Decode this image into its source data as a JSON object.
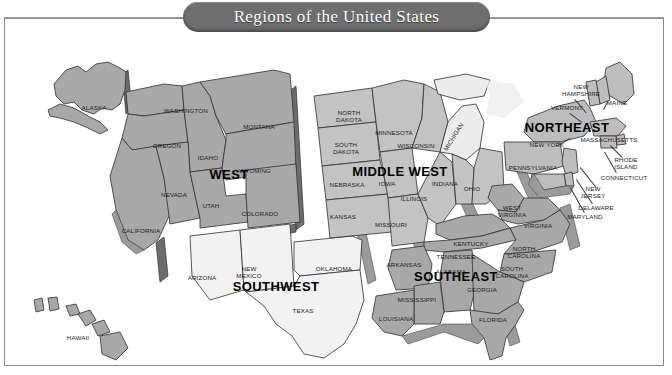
{
  "title": "Regions of the United States",
  "frame": {
    "border_color": "#8d8d8d",
    "background": "#ffffff"
  },
  "banner": {
    "fill": "#6e6e6e",
    "text_color": "#ffffff"
  },
  "regions": [
    {
      "key": "west",
      "label": "WEST",
      "fill": "#a8a8a8",
      "x": 225,
      "y": 156
    },
    {
      "key": "southwest",
      "label": "SOUTHWEST",
      "fill": "#f2f2f2",
      "x": 272,
      "y": 268
    },
    {
      "key": "middlewest",
      "label": "MIDDLE WEST",
      "fill": "#c3c3c3",
      "x": 396,
      "y": 153
    },
    {
      "key": "southeast",
      "label": "SOUTHEAST",
      "fill": "#a8a8a8",
      "x": 452,
      "y": 258
    },
    {
      "key": "northeast",
      "label": "NORTHEAST",
      "fill": "#bdbdbd",
      "x": 563,
      "y": 109
    }
  ],
  "states": [
    {
      "name": "ALASKA",
      "region": "west",
      "x": 90,
      "y": 90,
      "text": "ALASKA"
    },
    {
      "name": "HAWAII",
      "region": "west",
      "x": 74,
      "y": 320,
      "text": "HAWAII"
    },
    {
      "name": "WASHINGTON",
      "region": "west",
      "x": 182,
      "y": 93,
      "text": "WASHINGTON"
    },
    {
      "name": "OREGON",
      "region": "west",
      "x": 163,
      "y": 128,
      "text": "OREGON"
    },
    {
      "name": "CALIFORNIA",
      "region": "west",
      "x": 137,
      "y": 213,
      "text": "CALIFORNIA"
    },
    {
      "name": "IDAHO",
      "region": "west",
      "x": 204,
      "y": 140,
      "text": "IDAHO"
    },
    {
      "name": "NEVADA",
      "region": "west",
      "x": 170,
      "y": 177,
      "text": "NEVADA"
    },
    {
      "name": "UTAH",
      "region": "west",
      "x": 207,
      "y": 188,
      "text": "UTAH"
    },
    {
      "name": "MONTANA",
      "region": "west",
      "x": 255,
      "y": 109,
      "text": "MONTANA"
    },
    {
      "name": "WYOMING",
      "region": "west",
      "x": 251,
      "y": 153,
      "text": "WYOMING"
    },
    {
      "name": "COLORADO",
      "region": "west",
      "x": 256,
      "y": 196,
      "text": "COLORADO"
    },
    {
      "name": "ARIZONA",
      "region": "southwest",
      "x": 198,
      "y": 260,
      "text": "ARIZONA"
    },
    {
      "name": "NEW MEXICO",
      "region": "southwest",
      "x": 245,
      "y": 255,
      "text": "NEW\nMEXICO"
    },
    {
      "name": "OKLAHOMA",
      "region": "southwest",
      "x": 330,
      "y": 251,
      "text": "OKLAHOMA"
    },
    {
      "name": "TEXAS",
      "region": "southwest",
      "x": 299,
      "y": 293,
      "text": "TEXAS"
    },
    {
      "name": "NORTH DAKOTA",
      "region": "middlewest",
      "x": 345,
      "y": 99,
      "text": "NORTH\nDAKOTA"
    },
    {
      "name": "SOUTH DAKOTA",
      "region": "middlewest",
      "x": 342,
      "y": 131,
      "text": "SOUTH\nDAKOTA"
    },
    {
      "name": "NEBRASKA",
      "region": "middlewest",
      "x": 343,
      "y": 167,
      "text": "NEBRASKA"
    },
    {
      "name": "KANSAS",
      "region": "middlewest",
      "x": 339,
      "y": 199,
      "text": "KANSAS"
    },
    {
      "name": "MINNESOTA",
      "region": "middlewest",
      "x": 390,
      "y": 115,
      "text": "MINNESOTA"
    },
    {
      "name": "IOWA",
      "region": "middlewest",
      "x": 383,
      "y": 166,
      "text": "IOWA"
    },
    {
      "name": "MISSOURI",
      "region": "middlewest",
      "x": 387,
      "y": 207,
      "text": "MISSOURI"
    },
    {
      "name": "WISCONSIN",
      "region": "middlewest",
      "x": 412,
      "y": 128,
      "text": "WISCONSIN"
    },
    {
      "name": "ILLINOIS",
      "region": "middlewest",
      "x": 410,
      "y": 181,
      "text": "ILLINOIS"
    },
    {
      "name": "MICHIGAN",
      "region": "middlewest",
      "x": 450,
      "y": 119,
      "text": "MICHIGAN",
      "rotated": true
    },
    {
      "name": "INDIANA",
      "region": "middlewest",
      "x": 441,
      "y": 166,
      "text": "INDIANA"
    },
    {
      "name": "OHIO",
      "region": "middlewest",
      "x": 468,
      "y": 171,
      "text": "OHIO"
    },
    {
      "name": "NEW HAMPSHIRE",
      "region": "northeast",
      "x": 577,
      "y": 73,
      "text": "NEW\nHAMPSHIRE"
    },
    {
      "name": "VERMONT",
      "region": "northeast",
      "x": 563,
      "y": 90,
      "text": "VERMONT"
    },
    {
      "name": "MAINE",
      "region": "northeast",
      "x": 613,
      "y": 85,
      "text": "MAINE"
    },
    {
      "name": "MASSACHUSETTS",
      "region": "northeast",
      "x": 605,
      "y": 122,
      "text": "MASSACHUSETTS"
    },
    {
      "name": "NEW YORK",
      "region": "northeast",
      "x": 543,
      "y": 127,
      "text": "NEW YORK"
    },
    {
      "name": "RHODE ISLAND",
      "region": "northeast",
      "x": 622,
      "y": 146,
      "text": "RHODE\nISLAND"
    },
    {
      "name": "CONNECTICUT",
      "region": "northeast",
      "x": 620,
      "y": 160,
      "text": "CONNECTICUT"
    },
    {
      "name": "PENNSYLVANIA",
      "region": "northeast",
      "x": 529,
      "y": 150,
      "text": "PENNSYLVANIA"
    },
    {
      "name": "NEW JERSEY",
      "region": "northeast",
      "x": 589,
      "y": 175,
      "text": "NEW\nJERSEY"
    },
    {
      "name": "DELAWARE",
      "region": "northeast",
      "x": 592,
      "y": 190,
      "text": "DELAWARE"
    },
    {
      "name": "MARYLAND",
      "region": "northeast",
      "x": 581,
      "y": 199,
      "text": "MARYLAND"
    },
    {
      "name": "WEST VIRGINIA",
      "region": "southeast",
      "x": 508,
      "y": 194,
      "text": "WEST\nVIRGINIA"
    },
    {
      "name": "VIRGINIA",
      "region": "southeast",
      "x": 534,
      "y": 208,
      "text": "VIRGINIA"
    },
    {
      "name": "KENTUCKY",
      "region": "southeast",
      "x": 467,
      "y": 226,
      "text": "KENTUCKY"
    },
    {
      "name": "TENNESSEE",
      "region": "southeast",
      "x": 452,
      "y": 239,
      "text": "TENNESSEE"
    },
    {
      "name": "NORTH CAROLINA",
      "region": "southeast",
      "x": 520,
      "y": 235,
      "text": "NORTH\nCAROLINA"
    },
    {
      "name": "SOUTH CAROLINA",
      "region": "southeast",
      "x": 508,
      "y": 255,
      "text": "SOUTH\nCAROLINA"
    },
    {
      "name": "ARKANSAS",
      "region": "southeast",
      "x": 400,
      "y": 247,
      "text": "ARKANSAS"
    },
    {
      "name": "ALABAMA",
      "region": "southeast",
      "x": 447,
      "y": 254,
      "text": "ALABAMA"
    },
    {
      "name": "MISSISSIPPI",
      "region": "southeast",
      "x": 413,
      "y": 282,
      "text": "MISSISSIPPI"
    },
    {
      "name": "LOUISIANA",
      "region": "southeast",
      "x": 392,
      "y": 301,
      "text": "LOUISIANA"
    },
    {
      "name": "GEORGIA",
      "region": "southeast",
      "x": 478,
      "y": 272,
      "text": "GEORGIA"
    },
    {
      "name": "FLORIDA",
      "region": "southeast",
      "x": 489,
      "y": 302,
      "text": "FLORIDA"
    }
  ]
}
